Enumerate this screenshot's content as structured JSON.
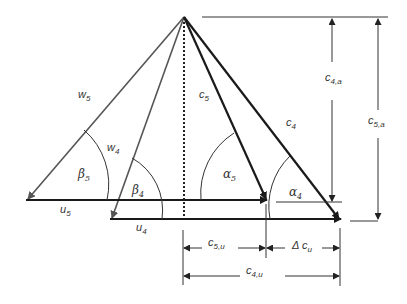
{
  "diagram": {
    "type": "velocity-triangle",
    "colors": {
      "absolute": "#1a1a1a",
      "relative": "#555555",
      "dimension": "#333333",
      "background": "#ffffff"
    },
    "vectors": {
      "w5": {
        "base": "w",
        "sub": "5"
      },
      "w4": {
        "base": "w",
        "sub": "4"
      },
      "c5": {
        "base": "c",
        "sub": "5"
      },
      "c4": {
        "base": "c",
        "sub": "4"
      },
      "u5": {
        "base": "u",
        "sub": "5"
      },
      "u4": {
        "base": "u",
        "sub": "4"
      }
    },
    "angles": {
      "beta5": {
        "base": "β",
        "sub": "5"
      },
      "beta4": {
        "base": "β",
        "sub": "4"
      },
      "alpha5": {
        "base": "α",
        "sub": "5"
      },
      "alpha4": {
        "base": "α",
        "sub": "4"
      }
    },
    "dimensions": {
      "c4a": {
        "base": "c",
        "sub": "4,a"
      },
      "c5a": {
        "base": "c",
        "sub": "5,a"
      },
      "c5u": {
        "base": "c",
        "sub": "5,u"
      },
      "dcu": {
        "base": "Δ c",
        "sub": "u"
      },
      "c4u": {
        "base": "c",
        "sub": "4,u"
      }
    }
  }
}
